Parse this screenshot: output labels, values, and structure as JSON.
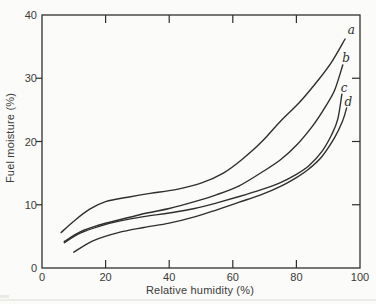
{
  "figure": {
    "background_color": "#fbfbf9",
    "line_color": "#2f2f2d",
    "text_color": "#3a3a38"
  },
  "chart_data": {
    "type": "line",
    "title": "",
    "xlabel": "Relative humidity (%)",
    "ylabel": "Fuel moisture (%)",
    "xlim": [
      0,
      100
    ],
    "ylim": [
      0,
      40
    ],
    "x_ticks": [
      0,
      20,
      40,
      60,
      80,
      100
    ],
    "y_ticks": [
      0,
      10,
      20,
      30,
      40
    ],
    "grid": false,
    "legend_position": "inline labels at right ends of curves",
    "series": [
      {
        "name": "a",
        "label": "a",
        "label_at": [
          97.3,
          37.6
        ],
        "points": [
          [
            6,
            5.6
          ],
          [
            10,
            7.4
          ],
          [
            15,
            9.3
          ],
          [
            20,
            10.5
          ],
          [
            27,
            11.2
          ],
          [
            34,
            11.8
          ],
          [
            42,
            12.4
          ],
          [
            50,
            13.4
          ],
          [
            57,
            15.0
          ],
          [
            63,
            17.2
          ],
          [
            69,
            19.9
          ],
          [
            75,
            23.2
          ],
          [
            81,
            26.2
          ],
          [
            87,
            29.8
          ],
          [
            91,
            32.5
          ],
          [
            95.3,
            36.2
          ]
        ]
      },
      {
        "name": "b",
        "label": "b",
        "label_at": [
          95.6,
          33.2
        ],
        "points": [
          [
            7,
            4.2
          ],
          [
            12,
            5.7
          ],
          [
            18,
            6.8
          ],
          [
            25,
            7.7
          ],
          [
            33,
            8.7
          ],
          [
            40,
            9.4
          ],
          [
            48,
            10.5
          ],
          [
            55,
            11.6
          ],
          [
            62,
            13.0
          ],
          [
            69,
            15.1
          ],
          [
            75,
            17.1
          ],
          [
            80,
            19.4
          ],
          [
            85,
            22.4
          ],
          [
            89,
            25.4
          ],
          [
            92,
            28.1
          ],
          [
            94.6,
            32.1
          ]
        ]
      },
      {
        "name": "c",
        "label": "c",
        "label_at": [
          95.0,
          28.5
        ],
        "points": [
          [
            7,
            4.0
          ],
          [
            12,
            5.5
          ],
          [
            18,
            6.6
          ],
          [
            25,
            7.5
          ],
          [
            33,
            8.2
          ],
          [
            40,
            8.7
          ],
          [
            48,
            9.4
          ],
          [
            55,
            10.3
          ],
          [
            62,
            11.3
          ],
          [
            69,
            12.4
          ],
          [
            75,
            13.5
          ],
          [
            80,
            14.8
          ],
          [
            84,
            16.2
          ],
          [
            88,
            18.4
          ],
          [
            91,
            21.0
          ],
          [
            93,
            23.5
          ],
          [
            94.3,
            27.5
          ]
        ]
      },
      {
        "name": "d",
        "label": "d",
        "label_at": [
          96.3,
          26.2
        ],
        "points": [
          [
            10,
            2.5
          ],
          [
            16,
            4.3
          ],
          [
            24,
            5.6
          ],
          [
            32,
            6.4
          ],
          [
            40,
            7.1
          ],
          [
            48,
            8.1
          ],
          [
            55,
            9.2
          ],
          [
            62,
            10.4
          ],
          [
            69,
            11.6
          ],
          [
            75,
            12.9
          ],
          [
            80,
            14.3
          ],
          [
            84,
            15.7
          ],
          [
            88,
            17.6
          ],
          [
            92,
            20.6
          ],
          [
            94.5,
            23.2
          ],
          [
            95.8,
            25.3
          ]
        ]
      }
    ]
  }
}
